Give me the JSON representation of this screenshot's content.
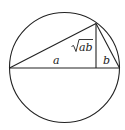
{
  "diagram": {
    "labels": {
      "a": "a",
      "b": "b",
      "sqrt_ab": "ab",
      "sqrt_symbol": "√"
    },
    "colors": {
      "stroke": "#222222",
      "background": "#ffffff"
    }
  }
}
